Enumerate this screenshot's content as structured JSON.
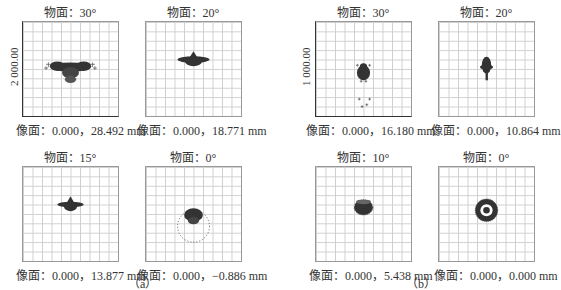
{
  "corner_fragment": "…",
  "groups": [
    {
      "label": "（a）",
      "y_scale_label": "2 000.00",
      "plots": [
        {
          "title": "物面：30°",
          "caption": "像面：0.000，28.492 mm",
          "pattern": "wing-with-tail"
        },
        {
          "title": "物面：20°",
          "caption": "像面：0.000，18.771 mm",
          "pattern": "wing"
        },
        {
          "title": "物面：15°",
          "caption": "像面：0.000，13.877 mm",
          "pattern": "wing-small"
        },
        {
          "title": "物面：0°",
          "caption": "像面：0.000，−0.886 mm",
          "pattern": "ring-with-blob"
        }
      ]
    },
    {
      "label": "（b）",
      "y_scale_label": "1 000.00",
      "plots": [
        {
          "title": "物面：30°",
          "caption": "像面：0.000，16.180 mm",
          "pattern": "blob-with-tail-points"
        },
        {
          "title": "物面：20°",
          "caption": "像面：0.000，10.864 mm",
          "pattern": "vertical-spindle"
        },
        {
          "title": "物面：10°",
          "caption": "像面：0.000，5.438 mm",
          "pattern": "barrel"
        },
        {
          "title": "物面：0°",
          "caption": "像面：0.000，0.000 mm",
          "pattern": "donut"
        }
      ]
    }
  ],
  "colors": {
    "spot": "#333333",
    "spot_ring": "#555555",
    "grid": "#cfcfcf"
  }
}
